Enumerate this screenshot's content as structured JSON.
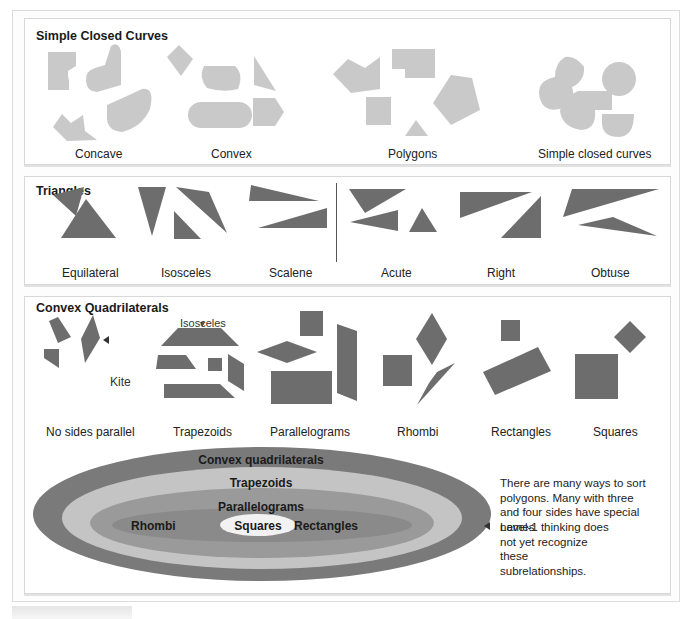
{
  "sections": {
    "simple_closed_curves": {
      "title": "Simple Closed Curves",
      "groups": [
        {
          "label": "Concave"
        },
        {
          "label": "Convex"
        },
        {
          "label": "Polygons"
        },
        {
          "label": "Simple closed curves"
        }
      ]
    },
    "triangles": {
      "title": "Triangles",
      "groups_by_sides": [
        {
          "label": "Equilateral"
        },
        {
          "label": "Isosceles"
        },
        {
          "label": "Scalene"
        }
      ],
      "groups_by_angles": [
        {
          "label": "Acute"
        },
        {
          "label": "Right"
        },
        {
          "label": "Obtuse"
        }
      ]
    },
    "convex_quadrilaterals": {
      "title": "Convex Quadrilaterals",
      "annotations": {
        "isosceles": "Isosceles",
        "kite": "Kite"
      },
      "groups": [
        {
          "label": "No sides parallel"
        },
        {
          "label": "Trapezoids"
        },
        {
          "label": "Parallelograms"
        },
        {
          "label": "Rhombi"
        },
        {
          "label": "Rectangles"
        },
        {
          "label": "Squares"
        }
      ],
      "nested_diagram": {
        "levels": [
          {
            "label": "Convex quadrilaterals",
            "color": "#7a7a7a"
          },
          {
            "label": "Trapezoids",
            "color": "#c4c4c4"
          },
          {
            "label": "Parallelograms",
            "color": "#9a9a9a"
          },
          {
            "left": "Rhombi",
            "right": "Rectangles",
            "color": "#8a8a8a"
          },
          {
            "label": "Squares",
            "color": "#f2f2f2"
          }
        ]
      },
      "side_note": "There are many ways to sort polygons. Many with three and four sides have special names.",
      "level_note": "Level-1 thinking does not yet recognize these subrelationships."
    }
  },
  "colors": {
    "light_shape": "#c9c9c9",
    "dark_shape": "#6d6d6d"
  }
}
